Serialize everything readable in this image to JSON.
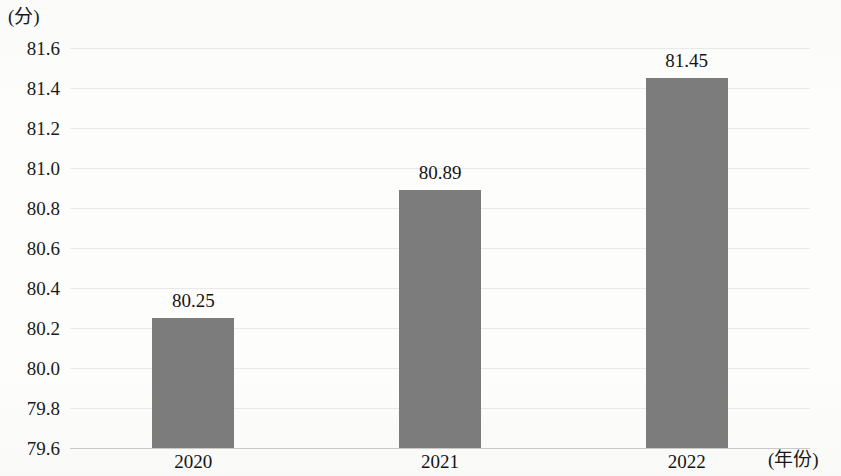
{
  "chart_data": {
    "type": "bar",
    "title": "",
    "subtitle": "",
    "xlabel": "(年份)",
    "ylabel": "(分)",
    "categories": [
      "2020",
      "2021",
      "2022"
    ],
    "values": [
      80.25,
      80.89,
      81.45
    ],
    "value_labels": [
      "80.25",
      "80.89",
      "81.45"
    ],
    "series": [
      {
        "name": "",
        "values": [
          80.25,
          80.89,
          81.45
        ]
      }
    ],
    "ylim": [
      79.6,
      81.6
    ],
    "ytick_step": 0.2,
    "ytick_labels": [
      "81.6",
      "81.4",
      "81.2",
      "81.0",
      "80.8",
      "80.6",
      "80.4",
      "80.2",
      "80.0",
      "79.8",
      "79.6"
    ],
    "ytick_values": [
      81.6,
      81.4,
      81.2,
      81.0,
      80.8,
      80.6,
      80.4,
      80.2,
      80.0,
      79.8,
      79.6
    ],
    "grid": true,
    "grid_axis": "y",
    "legend": false,
    "legend_position": "none",
    "bar_color": "#7c7c7c",
    "gridline_color": "#e9e9e7",
    "axis_color": "#c9c9c6",
    "background_color": "#fdfdfc",
    "text_color": "#141414"
  }
}
